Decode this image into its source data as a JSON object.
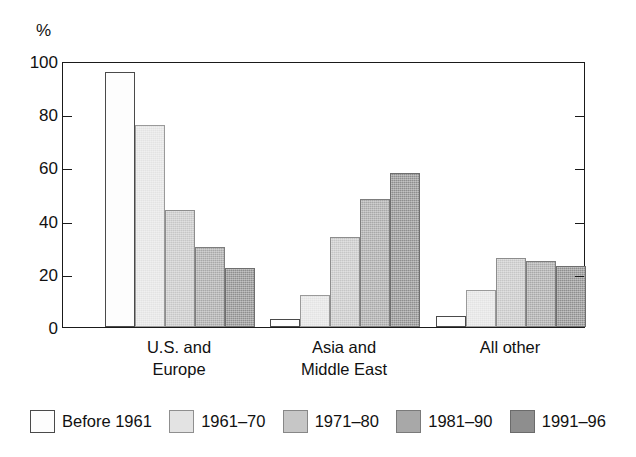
{
  "chart_data": {
    "type": "bar",
    "title": "",
    "xlabel": "",
    "ylabel": "%",
    "ylim": [
      0,
      100
    ],
    "yticks": [
      0,
      20,
      40,
      60,
      80,
      100
    ],
    "grid": false,
    "legend_position": "bottom",
    "categories": [
      "U.S. and\nEurope",
      "Asia and\nMiddle East",
      "All other"
    ],
    "series": [
      {
        "name": "Before 1961",
        "color": "#fdfdfd",
        "values": [
          96,
          3,
          4
        ]
      },
      {
        "name": "1961–70",
        "color": "#e3e3e3",
        "values": [
          76,
          12,
          14
        ]
      },
      {
        "name": "1971–80",
        "color": "#c6c6c6",
        "values": [
          44,
          34,
          26
        ]
      },
      {
        "name": "1981–90",
        "color": "#a8a8a8",
        "values": [
          30,
          48,
          25
        ]
      },
      {
        "name": "1991–96",
        "color": "#8e8e8e",
        "values": [
          22,
          58,
          23
        ]
      }
    ]
  }
}
